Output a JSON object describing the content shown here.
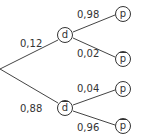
{
  "tree": {
    "level1": [
      {
        "node": "d",
        "overline": false,
        "prob": "0,12"
      },
      {
        "node": "d",
        "overline": true,
        "prob": "0,88"
      }
    ],
    "level2": [
      {
        "parent": "d",
        "node": "p",
        "overline": false,
        "prob": "0,98"
      },
      {
        "parent": "d",
        "node": "p",
        "overline": true,
        "prob": "0,02"
      },
      {
        "parent": "d-bar",
        "node": "p",
        "overline": false,
        "prob": "0,04"
      },
      {
        "parent": "d-bar",
        "node": "p",
        "overline": true,
        "prob": "0,96"
      }
    ]
  }
}
